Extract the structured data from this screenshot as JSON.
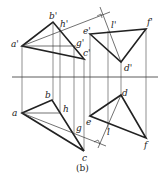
{
  "figure": {
    "caption": "(b)",
    "axis_label": "projection axis (X)",
    "colors": {
      "line": "#222222",
      "background": "#ffffff"
    }
  },
  "labels": {
    "a_prime": "a'",
    "b_prime": "b'",
    "c_prime": "c'",
    "h_prime": "h'",
    "g_prime": "g'",
    "e_prime": "e'",
    "f_prime": "f'",
    "d_prime": "d'",
    "l_prime": "l'",
    "a": "a",
    "b": "b",
    "c": "c",
    "h": "h",
    "g": "g",
    "e": "e",
    "f": "f",
    "d": "d",
    "l": "l"
  }
}
